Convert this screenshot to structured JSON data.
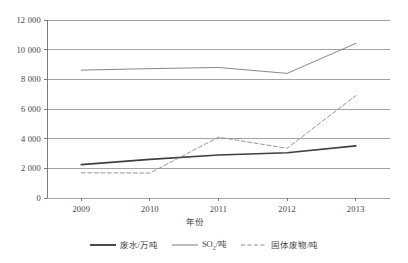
{
  "chart_data": {
    "type": "line",
    "title": "",
    "xlabel": "年份",
    "ylabel": "",
    "x": [
      "2009",
      "2010",
      "2011",
      "2012",
      "2013"
    ],
    "categories": [
      "2009",
      "2010",
      "2011",
      "2012",
      "2013"
    ],
    "ylim": [
      0,
      12000
    ],
    "xlim": [
      "2009",
      "2013"
    ],
    "ytick_labels": [
      "0",
      "2 000",
      "4 000",
      "6 000",
      "8 000",
      "10 000",
      "12 000"
    ],
    "ytick_values": [
      0,
      2000,
      4000,
      6000,
      8000,
      10000,
      12000
    ],
    "xtick_labels": [
      "2009",
      "2010",
      "2011",
      "2012",
      "2013"
    ],
    "grid": "horizontal",
    "legend_position": "bottom",
    "series": [
      {
        "name": "废水/万吨",
        "style": "solid",
        "color": "#404040",
        "width": 1.7,
        "values": [
          2250,
          2600,
          2900,
          3050,
          3520
        ]
      },
      {
        "name": "SO₂/吨",
        "style": "solid",
        "color": "#7a7a7a",
        "width": 0.9,
        "values": [
          8620,
          8720,
          8800,
          8400,
          10420
        ]
      },
      {
        "name": "固体废物/吨",
        "style": "dashed",
        "color": "#8a8a8a",
        "width": 0.9,
        "values": [
          1700,
          1680,
          4100,
          3350,
          6900
        ]
      }
    ]
  },
  "legend": {
    "items": [
      {
        "label_main": "废水/万吨",
        "label_sub": "",
        "label_tail": "",
        "style": "solid",
        "color": "#404040",
        "width": 1.9
      },
      {
        "label_main": "SO",
        "label_sub": "2",
        "label_tail": "/吨",
        "style": "solid",
        "color": "#7a7a7a",
        "width": 1.0
      },
      {
        "label_main": "固体废物/吨",
        "label_sub": "",
        "label_tail": "",
        "style": "dashed",
        "color": "#8a8a8a",
        "width": 1.0
      }
    ]
  },
  "axes": {
    "x_title": "年份"
  },
  "colors": {
    "grid": "#8c8c8c",
    "axis": "#6e6e6e",
    "text": "#444444",
    "series_wastewater": "#404040",
    "series_so2": "#7a7a7a",
    "series_solidwaste": "#8a8a8a"
  }
}
